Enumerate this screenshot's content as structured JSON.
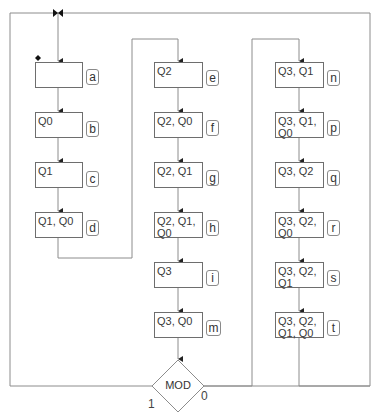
{
  "diagram": {
    "type": "ASM state flowchart",
    "states": [
      {
        "id": "a",
        "outputs": ""
      },
      {
        "id": "b",
        "outputs": "Q0"
      },
      {
        "id": "c",
        "outputs": "Q1"
      },
      {
        "id": "d",
        "outputs": "Q1, Q0"
      },
      {
        "id": "e",
        "outputs": "Q2"
      },
      {
        "id": "f",
        "outputs": "Q2, Q0"
      },
      {
        "id": "g",
        "outputs": "Q2, Q1"
      },
      {
        "id": "h",
        "outputs": "Q2, Q1,\nQ0"
      },
      {
        "id": "i",
        "outputs": "Q3"
      },
      {
        "id": "m",
        "outputs": "Q3, Q0"
      },
      {
        "id": "n",
        "outputs": "Q3, Q1"
      },
      {
        "id": "p",
        "outputs": "Q3, Q1,\nQ0"
      },
      {
        "id": "q",
        "outputs": "Q3, Q2"
      },
      {
        "id": "r",
        "outputs": "Q3, Q2,\nQ0"
      },
      {
        "id": "s",
        "outputs": "Q3, Q2,\nQ1"
      },
      {
        "id": "t",
        "outputs": "Q3, Q2,\nQ1, Q0"
      }
    ],
    "decision": {
      "label": "MOD",
      "branch_true": "1",
      "branch_false": "0"
    },
    "colors": {
      "line": "#8c8c8c",
      "box_border": "#6e6e6e",
      "text": "#3a3a3a"
    }
  }
}
